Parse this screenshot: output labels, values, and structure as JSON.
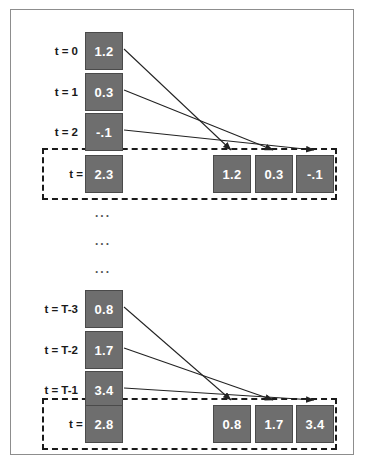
{
  "figure": {
    "frame_border_color": "#8d8d8d",
    "cell_fill_color": "#6e6e6e",
    "cell_text_color": "#ffffff",
    "dashed_border_color": "#1a1a1a",
    "arrow_color": "#222222"
  },
  "top_block": {
    "rows": [
      {
        "label": "t = 0",
        "value": "1.2"
      },
      {
        "label": "t = 1",
        "value": "0.3"
      },
      {
        "label": "t = 2",
        "value": "-.1"
      },
      {
        "label": "t = 3",
        "value": "2.3"
      }
    ],
    "context_values": [
      "1.2",
      "0.3",
      "-.1"
    ]
  },
  "ellipsis": {
    "dot_rows": [
      "...",
      "...",
      "..."
    ]
  },
  "bottom_block": {
    "rows": [
      {
        "label": "t = T-3",
        "value": "0.8"
      },
      {
        "label": "t = T-2",
        "value": "1.7"
      },
      {
        "label": "t = T-1",
        "value": "3.4"
      },
      {
        "label": "t = T",
        "value": "2.8"
      }
    ],
    "context_values": [
      "0.8",
      "1.7",
      "3.4"
    ]
  }
}
